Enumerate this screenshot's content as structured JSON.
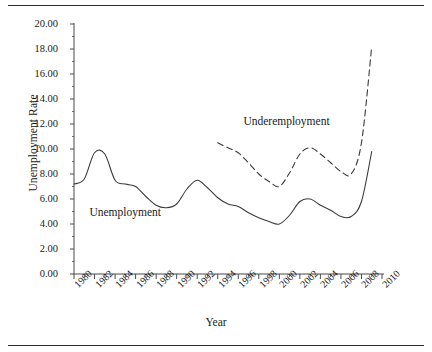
{
  "chart_data": {
    "type": "line",
    "title": "",
    "xlabel": "Year",
    "ylabel": "Unemployment Rate",
    "xlim": [
      1980,
      2010
    ],
    "ylim": [
      0,
      20
    ],
    "ytick_step": 2,
    "xtick_step": 2,
    "grid": false,
    "legend_position": "inline-annotation",
    "ytick_labels": [
      "0.00",
      "2.00",
      "4.00",
      "6.00",
      "8.00",
      "10.00",
      "12.00",
      "14.00",
      "16.00",
      "18.00",
      "20.00"
    ],
    "xtick_labels": [
      "1980",
      "1982",
      "1984",
      "1986",
      "1988",
      "1990",
      "1992",
      "1994",
      "1996",
      "1998",
      "2000",
      "2002",
      "2004",
      "2006",
      "2008",
      "2010"
    ],
    "series": [
      {
        "name": "Unemployment",
        "style": "solid",
        "color": "#3a3a3a",
        "label_x": 1981.5,
        "label_y": 4.9,
        "x": [
          1980,
          1981,
          1982,
          1983,
          1984,
          1985,
          1986,
          1987,
          1988,
          1989,
          1990,
          1991,
          1992,
          1993,
          1994,
          1995,
          1996,
          1997,
          1998,
          1999,
          2000,
          2001,
          2002,
          2003,
          2004,
          2005,
          2006,
          2007,
          2008,
          2009
        ],
        "y": [
          7.2,
          7.6,
          9.7,
          9.6,
          7.5,
          7.2,
          7.0,
          6.2,
          5.5,
          5.3,
          5.6,
          6.8,
          7.5,
          6.9,
          6.1,
          5.6,
          5.4,
          4.9,
          4.5,
          4.2,
          4.0,
          4.7,
          5.8,
          6.0,
          5.5,
          5.1,
          4.6,
          4.6,
          5.8,
          9.8
        ]
      },
      {
        "name": "Underemployment",
        "style": "dashed",
        "color": "#3a3a3a",
        "label_x": 1996.5,
        "label_y": 12.2,
        "x": [
          1994,
          1995,
          1996,
          1997,
          1998,
          1999,
          2000,
          2001,
          2002,
          2003,
          2004,
          2005,
          2006,
          2007,
          2008,
          2009
        ],
        "y": [
          10.5,
          10.1,
          9.7,
          8.9,
          8.0,
          7.4,
          7.0,
          8.1,
          9.6,
          10.1,
          9.6,
          8.9,
          8.2,
          8.0,
          10.5,
          18.2
        ]
      }
    ]
  },
  "axes": {
    "y_title": "Unemployment Rate",
    "x_title": "Year"
  },
  "annotations": {
    "unemployment": "Unemployment",
    "underemployment": "Underemployment"
  }
}
